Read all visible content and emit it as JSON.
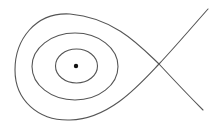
{
  "diagram": {
    "type": "phase-portrait",
    "colors": {
      "stroke": "#555555",
      "point": "#111111",
      "background": "#ffffff"
    },
    "center_point": {
      "x": 76,
      "y": 66,
      "r": 2.2
    },
    "saddle_point": {
      "x": 159,
      "y": 64
    },
    "orbits": [
      {
        "name": "inner-orbit",
        "cx": 76.5,
        "cy": 66,
        "rx": 21,
        "ry": 17
      },
      {
        "name": "middle-orbit",
        "cx": 75,
        "cy": 66.5,
        "rx": 43,
        "ry": 33.5
      }
    ],
    "separatrix": {
      "loop_path": "M159,64 C140,46 115,18 70,14 C35,12 15,40 15,70 C15,100 38,121 70,120 C110,119 140,84 159,64",
      "branch_upper_right": "M159,64 C175,47 192,27 208,9",
      "branch_lower_right": "M159,64 C172,78 188,95 203,110"
    }
  }
}
